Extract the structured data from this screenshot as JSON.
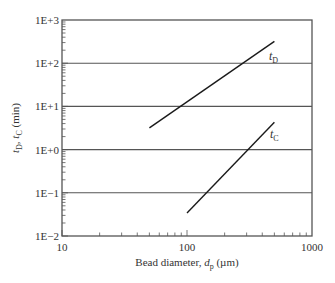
{
  "chart_data": {
    "type": "line",
    "title": "",
    "xlabel": "Bead diameter, d_p (µm)",
    "xlabel_parts": {
      "pre": "Bead diameter, ",
      "var": "d",
      "sub": "p",
      "post": " (µm)"
    },
    "ylabel": "t_D, t_C (min)",
    "ylabel_parts": {
      "v1": "t",
      "s1": "D",
      "mid": ", ",
      "v2": "t",
      "s2": "C",
      "post": " (min)"
    },
    "x_scale": "log",
    "y_scale": "log",
    "xlim": [
      10,
      1000
    ],
    "ylim": [
      0.01,
      1000
    ],
    "x_ticks": [
      10,
      100,
      1000
    ],
    "x_tick_labels": [
      "10",
      "100",
      "1000"
    ],
    "y_ticks": [
      0.01,
      0.1,
      1,
      10,
      100,
      1000
    ],
    "y_tick_labels": [
      "1E−2",
      "1E−1",
      "1E+0",
      "1E+1",
      "1E+2",
      "1E+3"
    ],
    "grid": {
      "horizontal": true,
      "vertical": false,
      "at": [
        0.1,
        1,
        10,
        100
      ]
    },
    "legend": "none (inline labels)",
    "series": [
      {
        "name": "t_D",
        "label_var": "t",
        "label_sub": "D",
        "x": [
          50,
          500
        ],
        "y": [
          3.2,
          320
        ],
        "note": "slope ~2 on log-log"
      },
      {
        "name": "t_C",
        "label_var": "t",
        "label_sub": "C",
        "x": [
          100,
          500
        ],
        "y": [
          0.034,
          4.3
        ],
        "note": "slope ~3 on log-log"
      }
    ]
  },
  "plot": {
    "left": 62,
    "right": 312,
    "top": 20,
    "bottom": 236,
    "line_color": "#1a1a1a",
    "grid_color": "#555555",
    "axis_color": "#555555"
  }
}
